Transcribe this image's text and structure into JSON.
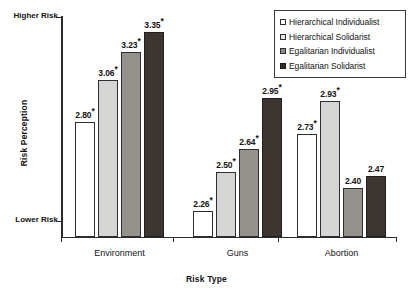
{
  "chart_data": {
    "type": "bar",
    "title": "",
    "xlabel": "Risk Type",
    "ylabel": "Risk Perception",
    "categories": [
      "Environment",
      "Guns",
      "Abortion"
    ],
    "series": [
      {
        "name": "Hierarchical Individualist",
        "color": "#ffffff",
        "values": [
          2.8,
          2.26,
          2.73
        ],
        "labels": [
          "2.80*",
          "2.26*",
          "2.73*"
        ]
      },
      {
        "name": "Hierarchical Solidarist",
        "color": "#d5d5d3",
        "values": [
          3.06,
          2.5,
          2.93
        ],
        "labels": [
          "3.06*",
          "2.50*",
          "2.93*"
        ]
      },
      {
        "name": "Egalitarian Individualist",
        "color": "#95928d",
        "values": [
          3.23,
          2.64,
          2.4
        ],
        "labels": [
          "3.23*",
          "2.64*",
          "2.40"
        ]
      },
      {
        "name": "Egalitarian Solidarist",
        "color": "#3d3531",
        "values": [
          3.35,
          2.95,
          2.47
        ],
        "labels": [
          "3.35*",
          "2.95*",
          "2.47"
        ]
      }
    ],
    "ylim": [
      2.1,
      3.45
    ],
    "ytick_labels": [
      "Higher Risk",
      "Lower Risk"
    ],
    "ytick_values": [
      3.45,
      2.25
    ],
    "grid": false,
    "legend_position": "top-right",
    "annotation": "* denotes statistically significant value"
  },
  "axes": {
    "y_title": "Risk Perception",
    "x_title": "Risk Type",
    "y_high_label": "Higher Risk",
    "y_low_label": "Lower Risk"
  },
  "legend": {
    "items": [
      {
        "label": "Hierarchical Individualist"
      },
      {
        "label": "Hierarchical Solidarist"
      },
      {
        "label": "Egalitarian Individualist"
      },
      {
        "label": "Egalitarian Solidarist"
      }
    ]
  }
}
